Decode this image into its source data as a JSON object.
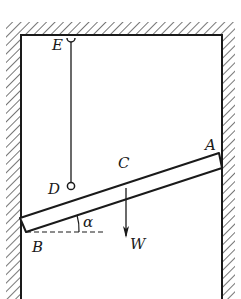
{
  "diagram": {
    "type": "statics-rod-in-channel",
    "labels": {
      "E": "E",
      "D": "D",
      "C": "C",
      "A": "A",
      "B": "B",
      "W": "W",
      "alpha": "α"
    },
    "colors": {
      "ink": "#1a1a1a",
      "background": "#ffffff"
    }
  }
}
